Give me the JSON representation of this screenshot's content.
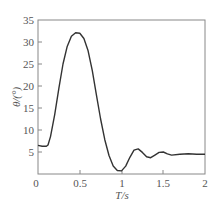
{
  "chart_data": {
    "type": "line",
    "title": "",
    "xlabel": "T/s",
    "ylabel": "θ/(°)",
    "xlim": [
      0,
      2
    ],
    "ylim": [
      0,
      35
    ],
    "xticks": [
      "0",
      "0.5",
      "1",
      "1.5",
      "2"
    ],
    "yticks": [
      "5",
      "10",
      "15",
      "20",
      "25",
      "30",
      "35"
    ],
    "grid": false,
    "legend": null,
    "series": [
      {
        "name": "θ",
        "x": [
          0,
          0.05,
          0.1,
          0.12,
          0.15,
          0.2,
          0.25,
          0.3,
          0.35,
          0.4,
          0.45,
          0.5,
          0.55,
          0.6,
          0.65,
          0.7,
          0.75,
          0.8,
          0.85,
          0.9,
          0.95,
          1.0,
          1.05,
          1.1,
          1.15,
          1.2,
          1.25,
          1.3,
          1.35,
          1.4,
          1.45,
          1.5,
          1.55,
          1.6,
          1.7,
          1.8,
          1.9,
          2.0
        ],
        "y": [
          6.5,
          6.3,
          6.3,
          6.6,
          8.5,
          13.5,
          19.5,
          25,
          29,
          31.3,
          32.1,
          32,
          30.8,
          28,
          23.5,
          18,
          12.5,
          7.8,
          4.2,
          1.8,
          0.8,
          0.7,
          1.8,
          3.8,
          5.4,
          5.7,
          4.9,
          3.9,
          3.7,
          4.3,
          4.9,
          5.0,
          4.6,
          4.3,
          4.5,
          4.6,
          4.5,
          4.5
        ]
      }
    ]
  },
  "labels": {
    "x0": "0",
    "x05": "0.5",
    "x1": "1",
    "x15": "1.5",
    "x2": "2",
    "y5": "5",
    "y10": "10",
    "y15": "15",
    "y20": "20",
    "y25": "25",
    "y30": "30",
    "y35": "35",
    "xlabel": "T/s",
    "ylabel": "θ/(°)"
  }
}
